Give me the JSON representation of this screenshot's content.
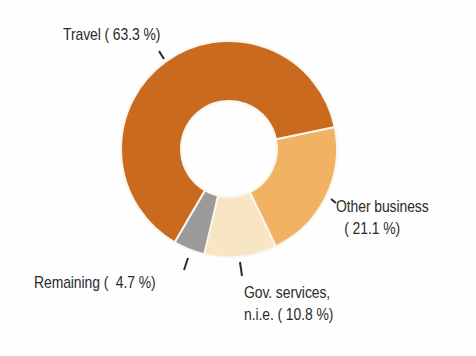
{
  "chart_data": {
    "type": "pie",
    "subtype": "donut",
    "title": "",
    "categories": [
      "Travel",
      "Other business",
      "Gov. services, n.i.e.",
      "Remaining"
    ],
    "values": [
      63.3,
      21.1,
      10.8,
      4.7
    ],
    "unit": "%",
    "colors": [
      "#c96a1e",
      "#f1b264",
      "#f7e5c3",
      "#9a9a9a"
    ],
    "start_angle_deg_clockwise_from_top": 78.3,
    "direction": "clockwise",
    "slice_order": [
      "Other business",
      "Gov. services, n.i.e.",
      "Remaining",
      "Travel"
    ],
    "legend": "none (direct labels with leader lines)",
    "grid": false
  },
  "geometry": {
    "cx": 229,
    "cy": 149,
    "outer_r": 108,
    "inner_r": 48,
    "separator_color": "#fbf4ea"
  },
  "labels": {
    "travel": {
      "line1": "Travel ( 63.3 %)"
    },
    "other": {
      "line1": "Other business",
      "line2": "( 21.1 %)"
    },
    "gov": {
      "line1": "Gov. services,",
      "line2": "n.i.e. ( 10.8 %)"
    },
    "remaining": {
      "line1": "Remaining (  4.7 %)"
    }
  },
  "leaders": [
    {
      "name": "travel",
      "x1": 159,
      "y1": 51,
      "x2": 164,
      "y2": 59
    },
    {
      "name": "other",
      "x1": 331,
      "y1": 199,
      "x2": 336,
      "y2": 203
    },
    {
      "name": "gov",
      "x1": 240,
      "y1": 262,
      "x2": 242,
      "y2": 276
    },
    {
      "name": "remaining",
      "x1": 188,
      "y1": 258,
      "x2": 184,
      "y2": 270
    }
  ],
  "text_color": "#2b2b2b"
}
